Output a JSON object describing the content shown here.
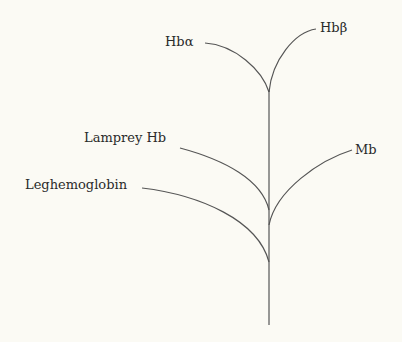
{
  "diagram": {
    "type": "phylogenetic-tree",
    "leaves": [
      {
        "id": "hba",
        "label": "Hbα"
      },
      {
        "id": "hbb",
        "label": "Hbβ"
      },
      {
        "id": "lamprey",
        "label": "Lamprey Hb"
      },
      {
        "id": "mb",
        "label": "Mb"
      },
      {
        "id": "leg",
        "label": "Leghemoglobin"
      }
    ],
    "branch_order_from_root": [
      "Leghemoglobin",
      "Lamprey Hb",
      "Mb",
      "Hbα / Hbβ"
    ],
    "line_color": "#555555",
    "background": "#fbfaf4"
  }
}
